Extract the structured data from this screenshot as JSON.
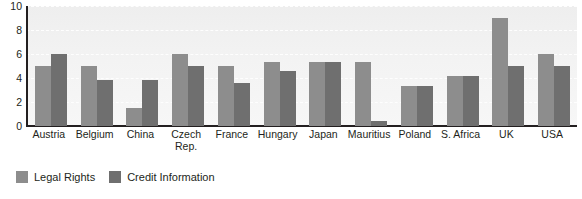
{
  "chart_data": {
    "type": "bar",
    "title": "",
    "subtitle": "",
    "xlabel": "",
    "ylabel": "",
    "ylim": [
      0,
      10
    ],
    "yticks": [
      0,
      2,
      4,
      6,
      8,
      10
    ],
    "grid": true,
    "grid_style": "dashed-white-horizontal",
    "legend_position": "bottom-left",
    "orientation": "vertical",
    "categories": [
      "Austria",
      "Belgium",
      "China",
      "Czech Rep.",
      "France",
      "Hungary",
      "Japan",
      "Mauritius",
      "Poland",
      "S. Africa",
      "UK",
      "USA"
    ],
    "series": [
      {
        "name": "Legal Rights",
        "color": "#8d8d8d",
        "values": [
          5,
          5,
          1.5,
          6,
          5,
          5.3,
          5.3,
          5.3,
          3.3,
          4.2,
          9,
          6
        ]
      },
      {
        "name": "Credit Information",
        "color": "#6f6f6f",
        "values": [
          6,
          3.8,
          3.8,
          5,
          3.6,
          4.6,
          5.3,
          0.45,
          3.3,
          4.2,
          5,
          5
        ]
      }
    ]
  },
  "axes": {
    "y_tick_labels": [
      "10",
      "8",
      "6",
      "4",
      "2",
      "0"
    ]
  },
  "legend": {
    "entries": [
      {
        "label": "Legal Rights",
        "swatch": "#8d8d8d"
      },
      {
        "label": "Credit Information",
        "swatch": "#6f6f6f"
      }
    ]
  },
  "colors": {
    "series_light": "#8d8d8d",
    "series_dark": "#6f6f6f",
    "axis": "#231f20",
    "plot_background": "#f3f3f3",
    "gridline": "#ffffff",
    "text": "#231f20"
  }
}
